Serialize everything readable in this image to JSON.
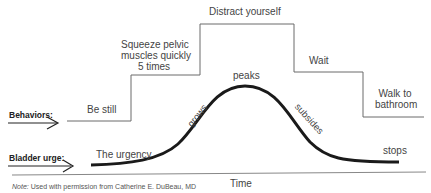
{
  "diagram": {
    "row_labels": {
      "behaviors": "Behaviors:",
      "bladder_urge": "Bladder urge:"
    },
    "behaviors": [
      {
        "label": "Be still"
      },
      {
        "label_lines": [
          "Squeeze pelvic",
          "muscles quickly",
          "5 times"
        ]
      },
      {
        "label": "Distract yourself"
      },
      {
        "label": "Wait"
      },
      {
        "label_lines": [
          "Walk to",
          "bathroom"
        ]
      }
    ],
    "urge_phases": {
      "start": "The urgency",
      "rise": "grows",
      "top": "peaks",
      "fall": "subsides",
      "end": "stops"
    },
    "axis": {
      "x_label": "Time"
    },
    "note": {
      "prefix": "Note:",
      "text": " Used with permission from Catherine E. DuBeau, MD"
    },
    "colors": {
      "curve": "#1a1a1a",
      "step_line": "#555555",
      "axis": "#777777",
      "text": "#444444"
    }
  }
}
